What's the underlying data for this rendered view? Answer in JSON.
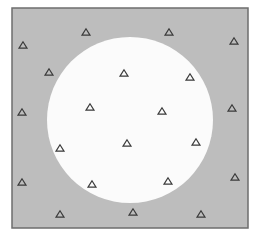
{
  "figure": {
    "width": 256,
    "height": 237,
    "box": {
      "x": 12,
      "y": 8,
      "w": 236,
      "h": 220,
      "fill": "#bdbdbd",
      "stroke": "#6e6e6e"
    },
    "circle": {
      "cx": 130,
      "cy": 120,
      "r": 83,
      "fill": "#fbfbfb"
    },
    "marker_style": {
      "shape": "triangle",
      "stroke": "#3a3a3a",
      "fill": "none",
      "size": 8
    },
    "markers": [
      {
        "x": 23,
        "y": 45,
        "region": "outside"
      },
      {
        "x": 86,
        "y": 32,
        "region": "outside"
      },
      {
        "x": 169,
        "y": 32,
        "region": "outside"
      },
      {
        "x": 234,
        "y": 41,
        "region": "outside"
      },
      {
        "x": 49,
        "y": 72,
        "region": "outside"
      },
      {
        "x": 124,
        "y": 73,
        "region": "inside"
      },
      {
        "x": 190,
        "y": 77,
        "region": "inside"
      },
      {
        "x": 90,
        "y": 107,
        "region": "inside"
      },
      {
        "x": 162,
        "y": 111,
        "region": "inside"
      },
      {
        "x": 22,
        "y": 112,
        "region": "outside"
      },
      {
        "x": 232,
        "y": 108,
        "region": "outside"
      },
      {
        "x": 60,
        "y": 148,
        "region": "inside"
      },
      {
        "x": 127,
        "y": 143,
        "region": "inside"
      },
      {
        "x": 196,
        "y": 142,
        "region": "inside"
      },
      {
        "x": 92,
        "y": 184,
        "region": "inside"
      },
      {
        "x": 168,
        "y": 181,
        "region": "inside"
      },
      {
        "x": 22,
        "y": 182,
        "region": "outside"
      },
      {
        "x": 235,
        "y": 177,
        "region": "outside"
      },
      {
        "x": 60,
        "y": 214,
        "region": "outside"
      },
      {
        "x": 133,
        "y": 212,
        "region": "outside"
      },
      {
        "x": 201,
        "y": 214,
        "region": "outside"
      }
    ]
  }
}
